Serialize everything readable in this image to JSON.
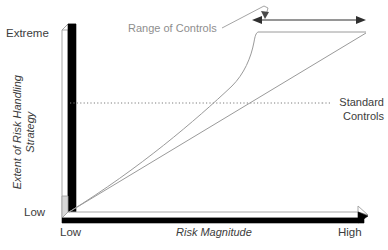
{
  "figure": {
    "type": "diagram",
    "background_color": "#ffffff",
    "width": 388,
    "height": 250
  },
  "axes": {
    "y": {
      "title": "Extent of Risk Handling Strategy",
      "title_line1": "Extent of Risk Handling",
      "title_line2": "Strategy",
      "min_label": "Low",
      "max_label": "Extreme",
      "style": "3d-block-arrow",
      "arrow_direction": "up",
      "color_front": "#000000",
      "color_side": "#ffffff",
      "outline_color": "#9a9a9a"
    },
    "x": {
      "title": "Risk Magnitude",
      "min_label": "Low",
      "max_label": "High",
      "style": "3d-block-arrow",
      "arrow_direction": "right",
      "color_front": "#000000",
      "color_side": "#ffffff",
      "outline_color": "#9a9a9a"
    }
  },
  "annotations": {
    "range_of_controls": {
      "label": "Range of Controls",
      "color": "#8e8e8e",
      "leader_line": true,
      "measure_arrow": "double-headed"
    },
    "standard_controls": {
      "label": "Standard Controls",
      "label_line1": "Standard",
      "label_line2": "Controls",
      "color": "#3c3c3c",
      "reference_line_style": "dotted"
    }
  },
  "series": [
    {
      "name": "risk-handling-curve",
      "style": "curve",
      "color": "#8e8e8e",
      "description": "Gradual rise then steep escalation to a plateau at Extreme"
    },
    {
      "name": "standard-controls-line",
      "style": "straight-diagonal",
      "color": "#8e8e8e",
      "description": "Linear proportional increase from Low/Low to High/Extreme"
    },
    {
      "name": "standard-controls-threshold",
      "style": "dotted-horizontal",
      "color": "#7a7a7a"
    }
  ],
  "icons": {
    "arrow_up": "arrow-up-icon",
    "arrow_right": "arrow-right-icon",
    "double_arrow": "double-headed-arrow-icon"
  }
}
